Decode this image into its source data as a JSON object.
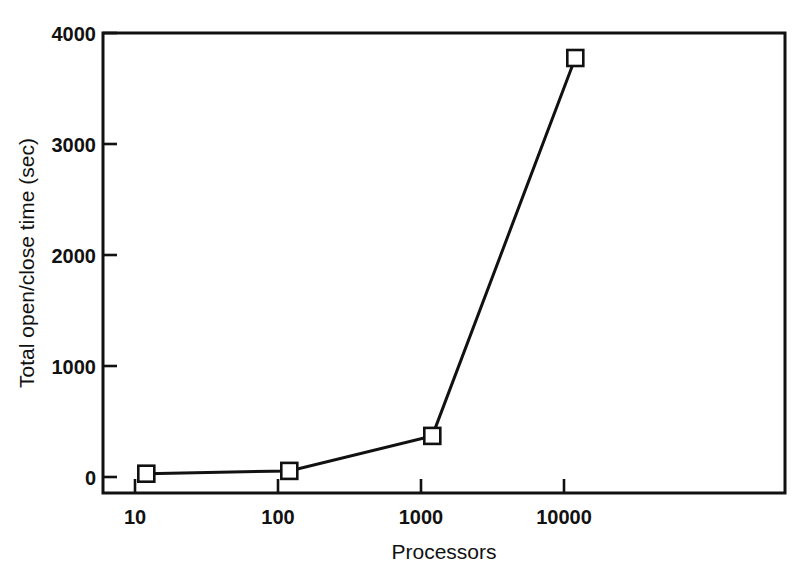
{
  "figure": {
    "background_color": "#ffffff",
    "foreground_color": "#111111",
    "width": 812,
    "height": 571
  },
  "chart_data": {
    "type": "line",
    "title": "",
    "subtitle": "",
    "xlabel": "Processors",
    "ylabel": "Total open/close time (sec)",
    "xscale": "log",
    "yscale": "linear",
    "xlim": [
      6.5,
      52000
    ],
    "ylim": [
      -150,
      4000
    ],
    "xticks": [
      10,
      100,
      1000,
      10000
    ],
    "xtick_labels": [
      "10",
      "100",
      "1000",
      "10000"
    ],
    "yticks": [
      0,
      1000,
      2000,
      3000,
      4000
    ],
    "ytick_labels": [
      "0",
      "1000",
      "2000",
      "3000",
      "4000"
    ],
    "grid": false,
    "legend": false,
    "legend_position": "none",
    "marker": "open-square",
    "marker_face_color": "#ffffff",
    "marker_edge_color": "#111111",
    "line_color": "#111111",
    "series": [
      {
        "name": "Total open/close time",
        "x": [
          12,
          120,
          1200,
          12000
        ],
        "values": [
          30,
          55,
          370,
          3775
        ]
      }
    ],
    "points": [
      {
        "x": 12,
        "y": 30
      },
      {
        "x": 120,
        "y": 55
      },
      {
        "x": 1200,
        "y": 370
      },
      {
        "x": 12000,
        "y": 3775
      }
    ],
    "annotations": []
  }
}
